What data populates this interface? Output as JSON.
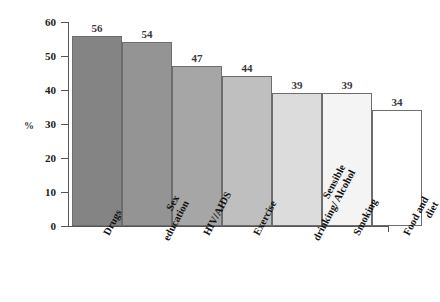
{
  "chart_data": {
    "type": "bar",
    "title": "",
    "xlabel": "",
    "ylabel": "%",
    "ylim": [
      0,
      60
    ],
    "ytick_labels": [
      "60",
      "50",
      "40",
      "30",
      "20",
      "10",
      "0"
    ],
    "yticks": [
      60,
      50,
      40,
      30,
      20,
      10,
      0
    ],
    "grid": false,
    "legend": "none",
    "categories": [
      "Drugs",
      "Sex education",
      "HIV/AIDS",
      "Exercise",
      "Sensible drinking/ Alcohol",
      "Smoking",
      "Food and diet"
    ],
    "values": [
      56,
      54,
      47,
      44,
      39,
      39,
      34
    ],
    "bar_labels": [
      "56",
      "54",
      "47",
      "44",
      "39",
      "39",
      "34"
    ],
    "bars": [
      {
        "label_line1": "Drugs",
        "label_line2": "",
        "value": 56,
        "value_label": "56",
        "color": "#848484"
      },
      {
        "label_line1": "Sex",
        "label_line2": "education",
        "value": 54,
        "value_label": "54",
        "color": "#949494"
      },
      {
        "label_line1": "HIV/AIDS",
        "label_line2": "",
        "value": 47,
        "value_label": "47",
        "color": "#a6a6a6"
      },
      {
        "label_line1": "Exercise",
        "label_line2": "",
        "value": 44,
        "value_label": "44",
        "color": "#bfbfbf"
      },
      {
        "label_line1": "Sensible",
        "label_line2": "drinking/ Alcohol",
        "value": 39,
        "value_label": "39",
        "color": "#dcdcdc"
      },
      {
        "label_line1": "Smoking",
        "label_line2": "",
        "value": 39,
        "value_label": "39",
        "color": "#f4f4f4"
      },
      {
        "label_line1": "Food and",
        "label_line2": "diet",
        "value": 34,
        "value_label": "34",
        "color": "#ffffff"
      }
    ],
    "colors": {
      "axis": "#555555",
      "bar_outline": "#6d6d6d",
      "value_text": "#3a3a3a",
      "tick_text": "#222222",
      "background": "#ffffff"
    }
  }
}
